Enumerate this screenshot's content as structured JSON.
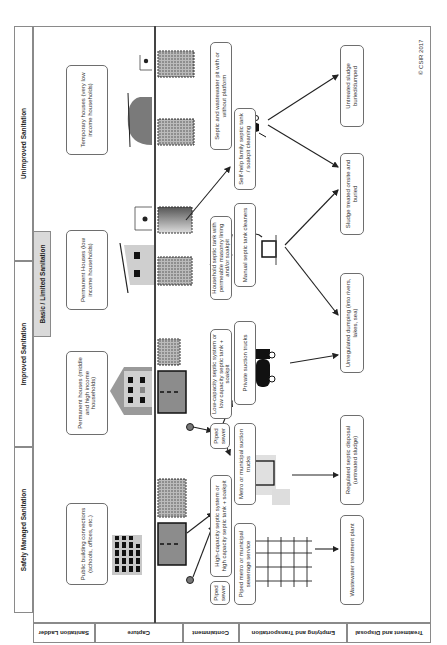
{
  "diagram": {
    "copyright": "© CSIR 2017",
    "row_labels": [
      {
        "id": "ladder",
        "label": "Sanitation Ladder"
      },
      {
        "id": "capture",
        "label": "Capture"
      },
      {
        "id": "containment",
        "label": "Containment"
      },
      {
        "id": "emptying",
        "label": "Emptying and Transportation"
      },
      {
        "id": "treatment",
        "label": "Treatment and Disposal"
      }
    ],
    "sanitation_ladder": {
      "safely_managed": "Safely Managed Sanitation",
      "improved": "Improved Sanitation",
      "basic_limited": "Basic / Limited Sanitation",
      "unimproved": "Unimproved Sanitation"
    },
    "capture": [
      {
        "id": "public",
        "label": "Public building connections (schools, offices, etc.)"
      },
      {
        "id": "permanent_mid_high",
        "label": "Permanent houses (middle and high income households)"
      },
      {
        "id": "permanent_low",
        "label": "Permanent Houses (low income households)"
      },
      {
        "id": "temporary",
        "label": "Temporary houses (very low income households)"
      }
    ],
    "containment": [
      {
        "id": "piped_sewer_1",
        "label": "Piped sewer"
      },
      {
        "id": "high_capacity",
        "label": "High-capacity septic system or high capacity septic tank + soakpit"
      },
      {
        "id": "piped_sewer_2",
        "label": "Piped sewer"
      },
      {
        "id": "low_capacity",
        "label": "Low-capacity septic system or low capacity septic tank + soakpit"
      },
      {
        "id": "household_septic",
        "label": "Household septic tank with permeable masonry lining and/or soakpit"
      },
      {
        "id": "septic_pit",
        "label": "Septic and wastewater pit with or without platform"
      }
    ],
    "emptying": [
      {
        "id": "piped_metro",
        "label": "Piped metro or municipal sewerage service"
      },
      {
        "id": "metro_trucks",
        "label": "Metro or municipal suction trucks"
      },
      {
        "id": "private_trucks",
        "label": "Private suction trucks"
      },
      {
        "id": "manual_cleaners",
        "label": "Manual septic tank cleaners"
      },
      {
        "id": "self_help",
        "label": "Self-help family septic tank / soakpit cleaning"
      }
    ],
    "treatment": [
      {
        "id": "wwtp",
        "label": "Wastewater treatment plant"
      },
      {
        "id": "regulated",
        "label": "Regulated septic disposal (untreated sludge)"
      },
      {
        "id": "unregulated",
        "label": "Unregulated dumping (into rivers, lakes, sea)"
      },
      {
        "id": "onsite",
        "label": "Sludge treated onsite and buried"
      },
      {
        "id": "untreated",
        "label": "Untreated sludge buried/dumped"
      }
    ],
    "icons": [
      "office-building",
      "apartment-house",
      "small-house",
      "shack",
      "septic-tank",
      "soakpit",
      "sewer-manhole",
      "sewer-network",
      "suction-truck",
      "manual-emptier",
      "wheelbarrow",
      "treatment-tank"
    ],
    "colors": {
      "frame": "#8a8a8a",
      "box_border": "#6e6e6e",
      "basic_band": "#d9d9d9",
      "tank_fill": "#8c8c8c",
      "text": "#333333"
    }
  }
}
